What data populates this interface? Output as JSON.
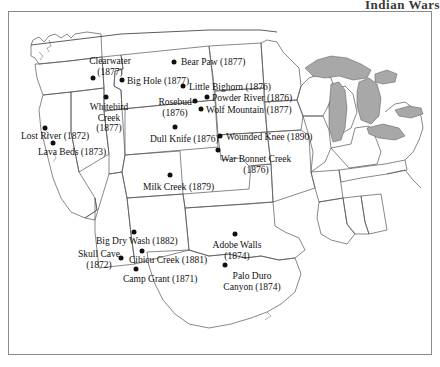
{
  "title": "Indian Wars",
  "map": {
    "frame_color": "#8a8a8a",
    "background_color": "#ffffff",
    "state_border_color": "#555555",
    "coastline_color": "#333333",
    "lake_fill_color": "#a8a8a8",
    "marker_color": "#101010",
    "label_color": "#111111"
  },
  "battles": [
    {
      "name": "Clearwater",
      "year": "(1877)",
      "label": "Clearwater\n(1877)",
      "dot": {
        "x": 84,
        "y": 66
      },
      "label_pos": {
        "x": 101,
        "y": 44
      },
      "align": "center"
    },
    {
      "name": "Bear Paw",
      "year": "(1877)",
      "label": "Bear Paw (1877)",
      "dot": {
        "x": 165,
        "y": 50
      },
      "label_pos": {
        "x": 172,
        "y": 45
      },
      "align": "left"
    },
    {
      "name": "Big Hole",
      "year": "(1877)",
      "label": "Big Hole (1877)",
      "dot": {
        "x": 113,
        "y": 68
      },
      "label_pos": {
        "x": 118,
        "y": 64
      },
      "align": "left"
    },
    {
      "name": "Little Bighorn",
      "year": "(1876)",
      "label": "Little Bighorn (1876)",
      "dot": {
        "x": 174,
        "y": 74
      },
      "label_pos": {
        "x": 180,
        "y": 70
      },
      "align": "left"
    },
    {
      "name": "Powder River",
      "year": "(1876)",
      "label": "Powder River (1876)",
      "dot": {
        "x": 198,
        "y": 85
      },
      "label_pos": {
        "x": 203,
        "y": 81
      },
      "align": "left"
    },
    {
      "name": "Whitebird Creek",
      "year": "(1877)",
      "label": "Whitebird\nCreek\n(1877)",
      "dot": {
        "x": 97,
        "y": 85
      },
      "label_pos": {
        "x": 100,
        "y": 90
      },
      "align": "center"
    },
    {
      "name": "Rosebud",
      "year": "(1876)",
      "label": "Rosebud\n(1876)",
      "dot": {
        "x": 186,
        "y": 89
      },
      "label_pos": {
        "x": 166,
        "y": 85
      },
      "align": "center"
    },
    {
      "name": "Wolf Mountain",
      "year": "(1877)",
      "label": "Wolf Mountain (1877)",
      "dot": {
        "x": 192,
        "y": 97
      },
      "label_pos": {
        "x": 197,
        "y": 93
      },
      "align": "left"
    },
    {
      "name": "Lost River",
      "year": "(1872)",
      "label": "Lost River (1872)",
      "dot": {
        "x": 36,
        "y": 116
      },
      "label_pos": {
        "x": 12,
        "y": 119
      },
      "align": "left"
    },
    {
      "name": "Wounded Knee",
      "year": "(1890)",
      "label": "Wounded Knee (1890)",
      "dot": {
        "x": 211,
        "y": 124
      },
      "label_pos": {
        "x": 217,
        "y": 120
      },
      "align": "left"
    },
    {
      "name": "Dull Knife",
      "year": "(1876)",
      "label": "Dull Knife (1876)",
      "dot": {
        "x": 166,
        "y": 115
      },
      "label_pos": {
        "x": 141,
        "y": 122
      },
      "align": "left"
    },
    {
      "name": "Lava Beds",
      "year": "(1873)",
      "label": "Lava Beds (1873)",
      "dot": {
        "x": 44,
        "y": 131
      },
      "label_pos": {
        "x": 29,
        "y": 135
      },
      "align": "left"
    },
    {
      "name": "War Bonnet Creek",
      "year": "(1876)",
      "label": "War Bonnet Creek\n(1876)",
      "dot": {
        "x": 209,
        "y": 138
      },
      "label_pos": {
        "x": 247,
        "y": 142
      },
      "align": "center"
    },
    {
      "name": "Milk Creek",
      "year": "(1879)",
      "label": "Milk Creek (1879)",
      "dot": {
        "x": 161,
        "y": 163
      },
      "label_pos": {
        "x": 134,
        "y": 170
      },
      "align": "left"
    },
    {
      "name": "Big Dry Wash",
      "year": "(1882)",
      "label": "Big Dry Wash (1882)",
      "dot": {
        "x": 125,
        "y": 220
      },
      "label_pos": {
        "x": 87,
        "y": 224
      },
      "align": "left"
    },
    {
      "name": "Adobe Walls",
      "year": "(1874)",
      "label": "Adobe Walls\n(1874)",
      "dot": {
        "x": 226,
        "y": 222
      },
      "label_pos": {
        "x": 228,
        "y": 228
      },
      "align": "center"
    },
    {
      "name": "Skull Cave",
      "year": "(1872)",
      "label": "Skull Cave\n(1872)",
      "dot": {
        "x": 112,
        "y": 246
      },
      "label_pos": {
        "x": 90,
        "y": 237
      },
      "align": "center"
    },
    {
      "name": "Cibicu Creek",
      "year": "(1881)",
      "label": "Cibicu Creek (1881)",
      "dot": {
        "x": 133,
        "y": 239
      },
      "label_pos": {
        "x": 120,
        "y": 243
      },
      "align": "left"
    },
    {
      "name": "Camp Grant",
      "year": "(1871)",
      "label": "Camp Grant (1871)",
      "dot": {
        "x": 127,
        "y": 257
      },
      "label_pos": {
        "x": 114,
        "y": 262
      },
      "align": "left"
    },
    {
      "name": "Palo Duro Canyon",
      "year": "(1874)",
      "label": "Palo Duro\nCanyon (1874)",
      "dot": {
        "x": 216,
        "y": 253
      },
      "label_pos": {
        "x": 243,
        "y": 259
      },
      "align": "center"
    }
  ]
}
